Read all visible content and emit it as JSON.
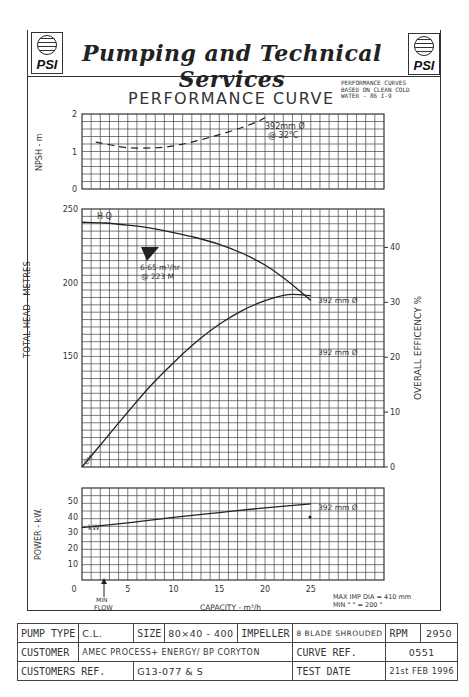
{
  "header": {
    "company": "Pumping and Technical Services",
    "logo_text": "PSI",
    "title": "PERFORMANCE CURVE",
    "note_lines": [
      "PERFORMANCE CURVES",
      "BASED ON CLEAN COLD",
      "WATER - 86 I-9"
    ]
  },
  "chart_data": [
    {
      "type": "line",
      "id": "npsh",
      "ylabel": "NPSH - m",
      "ylim": [
        0,
        2
      ],
      "yticks": [
        "0",
        "1",
        "2"
      ],
      "xlim": [
        0,
        33
      ],
      "grid": true,
      "series": [
        {
          "name": "392mm Ø @ 32°C",
          "style": "dashed",
          "x": [
            1.5,
            3,
            5,
            8,
            10,
            12,
            14,
            15,
            17,
            19,
            20
          ],
          "y": [
            1.25,
            1.18,
            1.1,
            1.1,
            1.15,
            1.25,
            1.38,
            1.45,
            1.6,
            1.78,
            1.9
          ]
        }
      ],
      "annotations": [
        "392mm Ø",
        "@ 32°C"
      ]
    },
    {
      "type": "line",
      "id": "head_efficiency",
      "ylabel": "TOTAL HEAD - METRES",
      "ylim": [
        75,
        250
      ],
      "yticks": [
        "150",
        "200",
        "250"
      ],
      "y2label": "OVERALL EFFICENCY %",
      "y2lim": [
        0,
        47
      ],
      "y2ticks": [
        "0",
        "10",
        "20",
        "30",
        "40"
      ],
      "xlim": [
        0,
        33
      ],
      "grid": true,
      "series": [
        {
          "name": "Head 392 mm Ø",
          "axis": "left",
          "x": [
            0,
            2.5,
            5,
            7.5,
            10,
            12.5,
            15,
            17.5,
            20,
            22.5,
            25
          ],
          "y": [
            241,
            240.5,
            239,
            237,
            234,
            230.5,
            226,
            220,
            212,
            201,
            188
          ]
        },
        {
          "name": "Efficiency 392 mm Ø",
          "axis": "right",
          "x": [
            0,
            2.5,
            5,
            7.5,
            10,
            12.5,
            15,
            17.5,
            20,
            22.5,
            25
          ],
          "y": [
            0,
            5,
            10,
            14.8,
            19,
            22.8,
            26,
            28.5,
            30.3,
            31.4,
            31.2
          ]
        }
      ],
      "annotations": [
        "H Q",
        "6·65 m³/hr",
        "@ 223 M",
        "392 mm Ø",
        "392 mm Ø",
        "EFF"
      ]
    },
    {
      "type": "line",
      "id": "power",
      "ylabel": "POWER - kW.",
      "ylim": [
        0,
        58
      ],
      "yticks": [
        "10",
        "20",
        "30",
        "40",
        "50"
      ],
      "xlabel": "CAPACITY - m³/h",
      "xlim": [
        0,
        33
      ],
      "xticks": [
        "0",
        "5",
        "10",
        "15",
        "20",
        "25"
      ],
      "grid": true,
      "series": [
        {
          "name": "kW 392 mm Ø",
          "x": [
            0,
            5,
            10,
            15,
            20,
            25
          ],
          "y": [
            33,
            36,
            39.5,
            42.5,
            45.5,
            48
          ]
        }
      ],
      "annotations": [
        "kW",
        "392 mm Ø",
        "MIN FLOW",
        "MAX IMP DIA = 410 mm",
        "MIN  \"   \" = 200 \""
      ]
    }
  ],
  "labels": {
    "npsh_ylabel": "NPSH - m",
    "npsh_ann1": "392mm Ø",
    "npsh_ann2": "@ 32°C",
    "head_ylabel": "TOTAL HEAD - METRES",
    "eff_ylabel": "OVERALL EFFICENCY %",
    "head_curve_label": "392 mm Ø",
    "eff_curve_label": "392 mm Ø",
    "hq_label": "H Q",
    "eff_label": "EFF",
    "bep_line1": "6·65 m³/hr",
    "bep_line2": "@ 223 M",
    "power_ylabel": "POWER - kW.",
    "power_curve_label": "392 mm Ø",
    "kw_label": "kW",
    "xlabel": "CAPACITY - m³/h",
    "min_flow_1": "MIN",
    "min_flow_2": "FLOW",
    "max_imp": "MAX IMP DIA = 410 mm",
    "min_imp": "MIN  \"    \" = 200  \""
  },
  "info_table": {
    "pump_type_label": "PUMP TYPE",
    "pump_type": "C.L.",
    "size_label": "SIZE",
    "size": "80×40 - 400",
    "impeller_label": "IMPELLER",
    "impeller": "8 BLADE SHROUDED",
    "rpm_label": "RPM",
    "rpm": "2950",
    "customer_label": "CUSTOMER",
    "customer": "AMEC PROCESS+ ENERGY/ BP CORYTON",
    "curve_ref_label": "CURVE REF.",
    "curve_ref": "0551",
    "customers_ref_label": "CUSTOMERS REF.",
    "customers_ref": "G13-077 & S",
    "test_date_label": "TEST DATE",
    "test_date": "21st FEB 1996"
  }
}
